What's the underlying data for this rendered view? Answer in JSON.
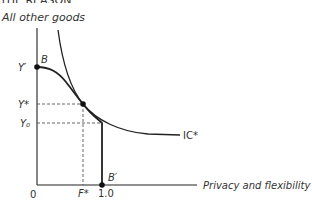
{
  "header": {
    "partial_title": "THE REASON"
  },
  "diagram": {
    "y_axis_label": "All other goods",
    "x_axis_label": "Privacy and flexibility",
    "origin_label": "0",
    "y_ticks": {
      "y_prime": "Y′",
      "y_star": "Y*",
      "y_zero": "Y₀"
    },
    "x_ticks": {
      "f_star": "F*",
      "one": "1.0"
    },
    "points": {
      "b": "B",
      "b_prime": "B′"
    },
    "curve_labels": {
      "ic": "IC*"
    },
    "colors": {
      "line": "#222222",
      "dash": "#555555",
      "text": "#333333"
    }
  }
}
